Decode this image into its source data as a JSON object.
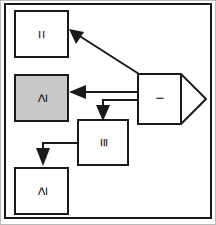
{
  "diagram": {
    "type": "block-diagram",
    "title": "",
    "frame": {
      "border_color": "#1a1a1a",
      "background": "#ffffff"
    },
    "colors": {
      "stroke": "#1a1a1a",
      "node_fill": "#ffffff",
      "highlight_fill": "#c8c8c8",
      "page_edge": "#b9b9b9"
    },
    "nodes": [
      {
        "id": "node-equals-top",
        "label": "=",
        "fill": "#ffffff",
        "shape": "rectangle",
        "orientation": "rotated-90",
        "x": 14,
        "y": 10,
        "w": 55,
        "h": 48
      },
      {
        "id": "node-geq-middle",
        "label": "≥",
        "fill": "#c8c8c8",
        "shape": "rectangle",
        "orientation": "rotated-90",
        "x": 14,
        "y": 74,
        "w": 55,
        "h": 48
      },
      {
        "id": "node-identical",
        "label": "≡",
        "fill": "#ffffff",
        "shape": "rectangle",
        "orientation": "rotated-90",
        "x": 77,
        "y": 119,
        "w": 52,
        "h": 47
      },
      {
        "id": "node-geq-bottom",
        "label": "≥",
        "fill": "#ffffff",
        "shape": "rectangle",
        "orientation": "rotated-90",
        "x": 14,
        "y": 167,
        "w": 55,
        "h": 48
      },
      {
        "id": "node-minus-source",
        "label": "−",
        "fill": "#ffffff",
        "shape": "pentagon-arrow-right",
        "orientation": "horizontal",
        "x": 137,
        "y": 73,
        "w": 70,
        "h": 52
      }
    ],
    "edges": [
      {
        "id": "edge-source-to-equals-top",
        "from": "node-minus-source",
        "to": "node-equals-top",
        "style": "diagonal",
        "arrowhead": true
      },
      {
        "id": "edge-source-to-geq-middle",
        "from": "node-minus-source",
        "to": "node-geq-middle",
        "style": "horizontal",
        "arrowhead": true
      },
      {
        "id": "edge-source-to-identical",
        "from": "node-minus-source",
        "to": "node-identical",
        "style": "orthogonal-down",
        "arrowhead": true
      },
      {
        "id": "edge-identical-to-geq-bottom",
        "from": "node-identical",
        "to": "node-geq-bottom",
        "style": "orthogonal-down",
        "arrowhead": true
      }
    ]
  }
}
